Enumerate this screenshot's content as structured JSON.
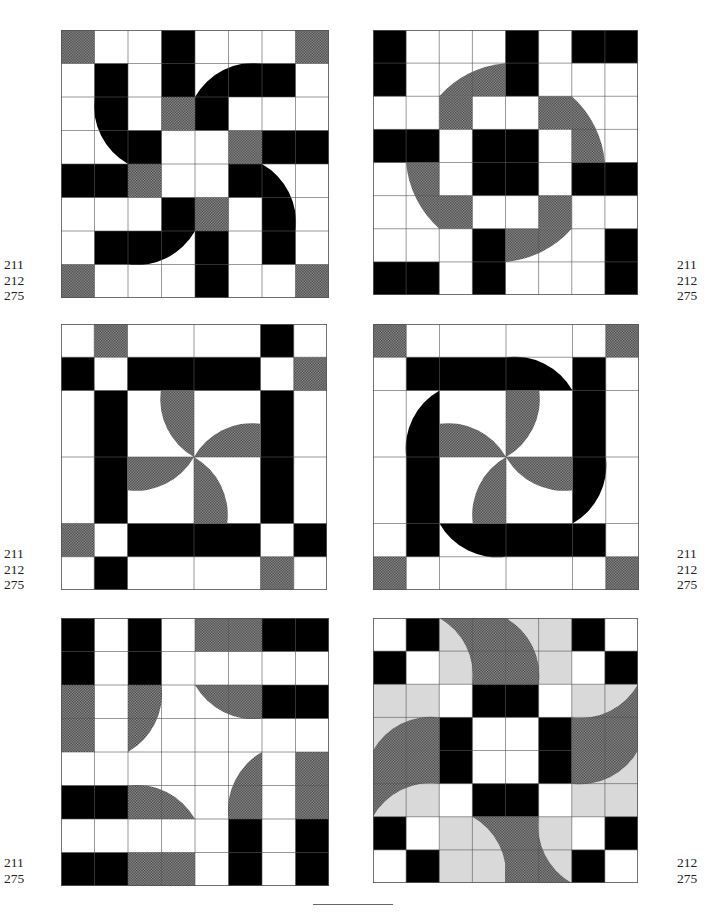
{
  "page": {
    "header_text": "——",
    "footer_rule": true
  },
  "colors": {
    "black": "#000000",
    "white": "#ffffff",
    "grid": "#555555",
    "hatch_dark": "#3a3a3a",
    "hatch_light": "#9a9a9a",
    "light_gray": "#d9d9d9"
  },
  "blocks": [
    {
      "id": "block-1",
      "position": {
        "x": 61,
        "y": 30,
        "size": 268
      },
      "refs": [
        "211",
        "212",
        "275"
      ],
      "refs_side": "left",
      "refs_pos": {
        "x": 4,
        "y": 257
      },
      "rects": [
        {
          "x": 0,
          "y": 0,
          "w": 1,
          "h": 1,
          "f": "h"
        },
        {
          "x": 7,
          "y": 0,
          "w": 1,
          "h": 1,
          "f": "h"
        },
        {
          "x": 0,
          "y": 7,
          "w": 1,
          "h": 1,
          "f": "h"
        },
        {
          "x": 7,
          "y": 7,
          "w": 1,
          "h": 1,
          "f": "h"
        },
        {
          "x": 3,
          "y": 0,
          "w": 1,
          "h": 2,
          "f": "b"
        },
        {
          "x": 3,
          "y": 2,
          "w": 1,
          "h": 1,
          "f": "h"
        },
        {
          "x": 5,
          "y": 3,
          "w": 1,
          "h": 1,
          "f": "h"
        },
        {
          "x": 2,
          "y": 4,
          "w": 1,
          "h": 1,
          "f": "h"
        },
        {
          "x": 4,
          "y": 5,
          "w": 1,
          "h": 1,
          "f": "h"
        },
        {
          "x": 6,
          "y": 3,
          "w": 2,
          "h": 1,
          "f": "b"
        },
        {
          "x": 0,
          "y": 4,
          "w": 2,
          "h": 1,
          "f": "b"
        },
        {
          "x": 4,
          "y": 6,
          "w": 1,
          "h": 2,
          "f": "b"
        }
      ],
      "paths": [
        {
          "d": "M1,1 H2 V3 H3 V4 H2 A2,2 0 0 1 1,2 Z",
          "f": "b"
        },
        {
          "d": "M4,2 A2,2 0 0 1 6,1 H7 V2 H5 V3 H4 Z",
          "f": "b"
        },
        {
          "d": "M5,4 H6 A2,2 0 0 1 7,6 V7 H6 V5 H5 Z",
          "f": "b"
        },
        {
          "d": "M1,6 H3 V5 H4 V6 A2,2 0 0 1 2,7 H1 Z",
          "f": "b"
        }
      ],
      "grid": {
        "v": [
          1,
          2,
          3,
          4,
          5,
          6,
          7
        ],
        "h": [
          1,
          2,
          3,
          4,
          5,
          6,
          7
        ]
      }
    },
    {
      "id": "block-2",
      "position": {
        "x": 373,
        "y": 30,
        "size": 265
      },
      "refs": [
        "211",
        "212",
        "275"
      ],
      "refs_side": "right",
      "refs_pos": {
        "x": 677,
        "y": 257
      },
      "paths_under": [
        {
          "d": "M2,2 A3,3 0 0 1 4,1 V2 Z",
          "f": "h"
        },
        {
          "d": "M6,2 A3,3 0 0 1 7,4 H6 Z",
          "f": "h"
        },
        {
          "d": "M1,4 H2 V6 A3,3 0 0 1 1,4 Z",
          "f": "h"
        },
        {
          "d": "M4,6 H6 A3,3 0 0 1 4,7 Z",
          "f": "h"
        }
      ],
      "rects": [
        {
          "x": 0,
          "y": 0,
          "w": 1,
          "h": 2,
          "f": "b"
        },
        {
          "x": 4,
          "y": 0,
          "w": 1,
          "h": 2,
          "f": "b"
        },
        {
          "x": 6,
          "y": 0,
          "w": 2,
          "h": 1,
          "f": "b"
        },
        {
          "x": 2,
          "y": 2,
          "w": 1,
          "h": 1,
          "f": "h"
        },
        {
          "x": 5,
          "y": 2,
          "w": 1,
          "h": 1,
          "f": "h"
        },
        {
          "x": 2,
          "y": 5,
          "w": 1,
          "h": 1,
          "f": "h"
        },
        {
          "x": 5,
          "y": 5,
          "w": 1,
          "h": 1,
          "f": "h"
        },
        {
          "x": 0,
          "y": 3,
          "w": 2,
          "h": 1,
          "f": "b"
        },
        {
          "x": 3,
          "y": 3,
          "w": 2,
          "h": 2,
          "f": "b"
        },
        {
          "x": 6,
          "y": 4,
          "w": 2,
          "h": 1,
          "f": "b"
        },
        {
          "x": 3,
          "y": 6,
          "w": 1,
          "h": 2,
          "f": "b"
        },
        {
          "x": 0,
          "y": 7,
          "w": 2,
          "h": 1,
          "f": "b"
        },
        {
          "x": 7,
          "y": 6,
          "w": 1,
          "h": 2,
          "f": "b"
        }
      ],
      "paths": [],
      "grid": {
        "v": [
          1,
          2,
          3,
          4,
          5,
          6,
          7
        ],
        "h": [
          1,
          2,
          3,
          4,
          5,
          6,
          7
        ]
      }
    },
    {
      "id": "block-3",
      "position": {
        "x": 61,
        "y": 324,
        "size": 266
      },
      "refs": [
        "211",
        "212",
        "275"
      ],
      "refs_side": "left",
      "refs_pos": {
        "x": 4,
        "y": 546
      },
      "rects": [
        {
          "x": 1,
          "y": 0,
          "w": 1,
          "h": 1,
          "f": "h"
        },
        {
          "x": 6,
          "y": 0,
          "w": 1,
          "h": 1,
          "f": "b"
        },
        {
          "x": 0,
          "y": 1,
          "w": 1,
          "h": 1,
          "f": "b"
        },
        {
          "x": 2,
          "y": 1,
          "w": 4,
          "h": 1,
          "f": "b"
        },
        {
          "x": 7,
          "y": 1,
          "w": 1,
          "h": 1,
          "f": "h"
        },
        {
          "x": 1,
          "y": 2,
          "w": 1,
          "h": 4,
          "f": "b"
        },
        {
          "x": 6,
          "y": 2,
          "w": 1,
          "h": 4,
          "f": "b"
        },
        {
          "x": 0,
          "y": 6,
          "w": 1,
          "h": 1,
          "f": "h"
        },
        {
          "x": 2,
          "y": 6,
          "w": 4,
          "h": 1,
          "f": "b"
        },
        {
          "x": 7,
          "y": 6,
          "w": 1,
          "h": 1,
          "f": "b"
        },
        {
          "x": 1,
          "y": 7,
          "w": 1,
          "h": 1,
          "f": "b"
        },
        {
          "x": 6,
          "y": 7,
          "w": 1,
          "h": 1,
          "f": "h"
        }
      ],
      "paths": [
        {
          "d": "M3,2 H4 V4 A2,2 0 0 1 3,2 Z",
          "f": "h"
        },
        {
          "d": "M4,4 A2,2 0 0 1 6,3 V4 Z",
          "f": "h"
        },
        {
          "d": "M4,4 V6 H5 A2,2 0 0 0 4,4 Z",
          "f": "h"
        },
        {
          "d": "M4,4 H2 V5 A2,2 0 0 0 4,4 Z",
          "f": "h"
        }
      ],
      "grid": {
        "v": [
          1,
          2,
          4,
          6,
          7
        ],
        "h": [
          1,
          2,
          4,
          6,
          7
        ]
      }
    },
    {
      "id": "block-4",
      "position": {
        "x": 373,
        "y": 324,
        "size": 266
      },
      "refs": [
        "211",
        "212",
        "275"
      ],
      "refs_side": "right",
      "refs_pos": {
        "x": 677,
        "y": 546
      },
      "rects": [
        {
          "x": 0,
          "y": 0,
          "w": 1,
          "h": 1,
          "f": "h"
        },
        {
          "x": 7,
          "y": 0,
          "w": 1,
          "h": 1,
          "f": "h"
        },
        {
          "x": 0,
          "y": 7,
          "w": 1,
          "h": 1,
          "f": "h"
        },
        {
          "x": 7,
          "y": 7,
          "w": 1,
          "h": 1,
          "f": "h"
        }
      ],
      "paths": [
        {
          "d": "M1,1 H4 A2,2 0 0 1 6,2 H1 Z",
          "f": "b"
        },
        {
          "d": "M6,1 H7 V4 A2,2 0 0 1 6,6 Z",
          "f": "b"
        },
        {
          "d": "M2,6 H7 V7 H4 A2,2 0 0 1 2,6 Z",
          "f": "b"
        },
        {
          "d": "M1,7 V4 A2,2 0 0 1 2,2 V7 Z",
          "f": "b"
        },
        {
          "d": "M4,2 H5 A2,2 0 0 1 4,4 Z",
          "f": "h"
        },
        {
          "d": "M4,4 H6 V5 A2,2 0 0 1 4,4 Z",
          "f": "h"
        },
        {
          "d": "M4,4 V6 H3 A2,2 0 0 1 4,4 Z",
          "f": "h"
        },
        {
          "d": "M4,4 H2 V3 A2,2 0 0 1 4,4 Z",
          "f": "h"
        }
      ],
      "grid": {
        "v": [
          1,
          2,
          4,
          6,
          7
        ],
        "h": [
          1,
          2,
          4,
          6,
          7
        ]
      }
    },
    {
      "id": "block-5",
      "position": {
        "x": 61,
        "y": 618,
        "size": 268
      },
      "refs": [
        "211",
        "275"
      ],
      "refs_side": "left",
      "refs_pos": {
        "x": 4,
        "y": 855
      },
      "rects": [
        {
          "x": 0,
          "y": 0,
          "w": 1,
          "h": 2,
          "f": "b"
        },
        {
          "x": 2,
          "y": 0,
          "w": 1,
          "h": 2,
          "f": "b"
        },
        {
          "x": 0,
          "y": 2,
          "w": 1,
          "h": 2,
          "f": "h"
        },
        {
          "x": 4,
          "y": 0,
          "w": 2,
          "h": 1,
          "f": "h"
        },
        {
          "x": 6,
          "y": 0,
          "w": 2,
          "h": 1,
          "f": "b"
        },
        {
          "x": 6,
          "y": 2,
          "w": 2,
          "h": 1,
          "f": "b"
        },
        {
          "x": 7,
          "y": 4,
          "w": 1,
          "h": 2,
          "f": "h"
        },
        {
          "x": 5,
          "y": 6,
          "w": 1,
          "h": 2,
          "f": "b"
        },
        {
          "x": 7,
          "y": 6,
          "w": 1,
          "h": 2,
          "f": "b"
        },
        {
          "x": 0,
          "y": 5,
          "w": 2,
          "h": 1,
          "f": "b"
        },
        {
          "x": 0,
          "y": 7,
          "w": 2,
          "h": 1,
          "f": "b"
        },
        {
          "x": 2,
          "y": 7,
          "w": 2,
          "h": 1,
          "f": "h"
        }
      ],
      "paths": [
        {
          "d": "M2,2 H3 A2,2 0 0 1 2,4 Z",
          "f": "h"
        },
        {
          "d": "M4,2 H6 V3 A2,2 0 0 1 4,2 Z",
          "f": "h"
        },
        {
          "d": "M6,4 V6 H5 A2,2 0 0 1 6,4 Z",
          "f": "h"
        },
        {
          "d": "M2,5 A2,2 0 0 1 4,6 H2 Z",
          "f": "h"
        }
      ],
      "grid": {
        "v": [
          1,
          2,
          3,
          4,
          5,
          6,
          7
        ],
        "h": [
          1,
          2,
          3,
          4,
          5,
          6,
          7
        ]
      }
    },
    {
      "id": "block-6",
      "position": {
        "x": 373,
        "y": 618,
        "size": 265
      },
      "refs": [
        "212",
        "275"
      ],
      "refs_side": "right",
      "refs_pos": {
        "x": 677,
        "y": 855
      },
      "rects": [
        {
          "x": 2,
          "y": 0,
          "w": 4,
          "h": 2,
          "f": "g"
        },
        {
          "x": 0,
          "y": 2,
          "w": 2,
          "h": 4,
          "f": "g"
        },
        {
          "x": 6,
          "y": 2,
          "w": 2,
          "h": 4,
          "f": "g"
        },
        {
          "x": 2,
          "y": 6,
          "w": 4,
          "h": 2,
          "f": "g"
        },
        {
          "x": 1,
          "y": 0,
          "w": 1,
          "h": 1,
          "f": "b"
        },
        {
          "x": 0,
          "y": 1,
          "w": 1,
          "h": 1,
          "f": "b"
        },
        {
          "x": 6,
          "y": 0,
          "w": 1,
          "h": 1,
          "f": "b"
        },
        {
          "x": 7,
          "y": 1,
          "w": 1,
          "h": 1,
          "f": "b"
        },
        {
          "x": 0,
          "y": 6,
          "w": 1,
          "h": 1,
          "f": "b"
        },
        {
          "x": 1,
          "y": 7,
          "w": 1,
          "h": 1,
          "f": "b"
        },
        {
          "x": 7,
          "y": 6,
          "w": 1,
          "h": 1,
          "f": "b"
        },
        {
          "x": 6,
          "y": 7,
          "w": 1,
          "h": 1,
          "f": "b"
        },
        {
          "x": 3,
          "y": 2,
          "w": 2,
          "h": 1,
          "f": "b"
        },
        {
          "x": 3,
          "y": 5,
          "w": 2,
          "h": 1,
          "f": "b"
        },
        {
          "x": 2,
          "y": 3,
          "w": 1,
          "h": 2,
          "f": "b"
        },
        {
          "x": 5,
          "y": 3,
          "w": 1,
          "h": 2,
          "f": "b"
        }
      ],
      "paths": [
        {
          "d": "M2,0 A2,2 0 0 1 3,2 H4 V0 Z",
          "f": "h"
        },
        {
          "d": "M4,0 H4 A2,2 0 0 1 5,2 H4 Z",
          "f": "h"
        },
        {
          "d": "M4,0 A2,2 0 0 1 5,2 H4 Z",
          "f": "h"
        },
        {
          "d": "M8,2 A2,2 0 0 1 6,3 V4 H8 Z",
          "f": "h"
        },
        {
          "d": "M8,4 A2,2 0 0 1 6,5 V4 Z",
          "f": "h"
        },
        {
          "d": "M3,6 A2,2 0 0 1 4,8 V6 Z",
          "f": "h"
        },
        {
          "d": "M4,6 H5 A2,2 0 0 0 6,8 H4 Z",
          "f": "h"
        },
        {
          "d": "M0,4 A2,2 0 0 1 2,3 V4 Z",
          "f": "h"
        },
        {
          "d": "M0,4 H2 V5 A2,2 0 0 0 0,6 Z",
          "f": "h"
        }
      ],
      "grid": {
        "v": [
          1,
          2,
          3,
          4,
          5,
          6,
          7
        ],
        "h": [
          1,
          2,
          3,
          4,
          5,
          6,
          7
        ]
      }
    }
  ]
}
